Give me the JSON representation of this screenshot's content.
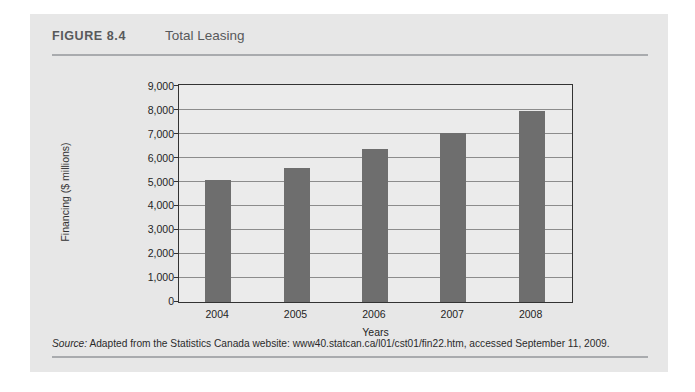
{
  "figure": {
    "number": "FIGURE 8.4",
    "title": "Total Leasing",
    "source_label": "Source:",
    "source_text": " Adapted from the Statistics Canada website: www40.statcan.ca/l01/cst01/fin22.htm, accessed September 11, 2009."
  },
  "colors": {
    "card_background": "#e7e7e7",
    "plot_background": "#ebebeb",
    "bar": "#6e6e6e",
    "axis": "#333333",
    "gridline": "#8c8c8c",
    "rule": "#a9abae",
    "header_text": "#58595b"
  },
  "chart_data": {
    "type": "bar",
    "title": "Total Leasing",
    "categories": [
      "2004",
      "2005",
      "2006",
      "2007",
      "2008"
    ],
    "values": [
      5100,
      5600,
      6400,
      7050,
      7950
    ],
    "xlabel": "Years",
    "ylabel": "Financing ($ millions)",
    "ylim": [
      0,
      9000
    ],
    "ytick_step": 1000,
    "yticks": [
      0,
      1000,
      2000,
      3000,
      4000,
      5000,
      6000,
      7000,
      8000,
      9000
    ],
    "ytick_labels": [
      "0",
      "1,000",
      "2,000",
      "3,000",
      "4,000",
      "5,000",
      "6,000",
      "7,000",
      "8,000",
      "9,000"
    ],
    "grid": true,
    "legend": false,
    "legend_position": "none"
  }
}
